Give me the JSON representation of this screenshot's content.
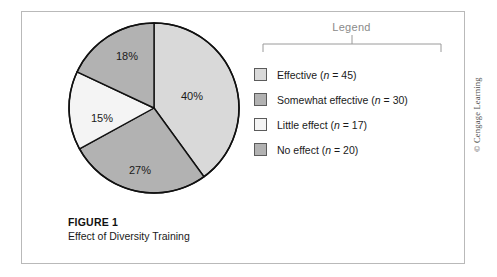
{
  "figure": {
    "caption_title": "FIGURE 1",
    "caption_subtitle": "Effect of Diversity Training",
    "copyright": "© Cengage Learning"
  },
  "legend": {
    "title": "Legend",
    "entries": [
      {
        "label": "Effective",
        "n_prefix": "(",
        "n_symbol": "n",
        "n_value": " = 45)",
        "full": "Effective (n = 45)",
        "color": "#d9d9d9"
      },
      {
        "label": "Somewhat effective",
        "n_prefix": "(",
        "n_symbol": "n",
        "n_value": " = 30)",
        "full": "Somewhat effective (n = 30)",
        "color": "#b2b2b2"
      },
      {
        "label": "Little effect",
        "n_prefix": "(",
        "n_symbol": "n",
        "n_value": " = 17)",
        "full": "Little effect (n = 17)",
        "color": "#f4f4f4"
      },
      {
        "label": "No effect",
        "n_prefix": "(",
        "n_symbol": "n",
        "n_value": " = 20)",
        "full": "No effect (n = 20)",
        "color": "#b2b2b2"
      }
    ]
  },
  "chart_data": {
    "type": "pie",
    "title": "Effect of Diversity Training",
    "categories": [
      "Effective",
      "Somewhat effective",
      "Little effect",
      "No effect"
    ],
    "values": [
      40,
      27,
      15,
      18
    ],
    "counts": [
      45,
      30,
      17,
      20
    ],
    "value_unit": "%",
    "data_labels": [
      "40%",
      "27%",
      "15%",
      "18%"
    ],
    "colors": [
      "#d9d9d9",
      "#b2b2b2",
      "#f4f4f4",
      "#b2b2b2"
    ],
    "start_angle_deg": 0,
    "direction": "clockwise",
    "legend_position": "right",
    "grid": false,
    "label_positions": [
      {
        "label": "40%",
        "x": 38,
        "y": -11
      },
      {
        "label": "27%",
        "x": -14,
        "y": 63
      },
      {
        "label": "15%",
        "x": -52,
        "y": 11
      },
      {
        "label": "18%",
        "x": -27,
        "y": -51
      }
    ]
  }
}
